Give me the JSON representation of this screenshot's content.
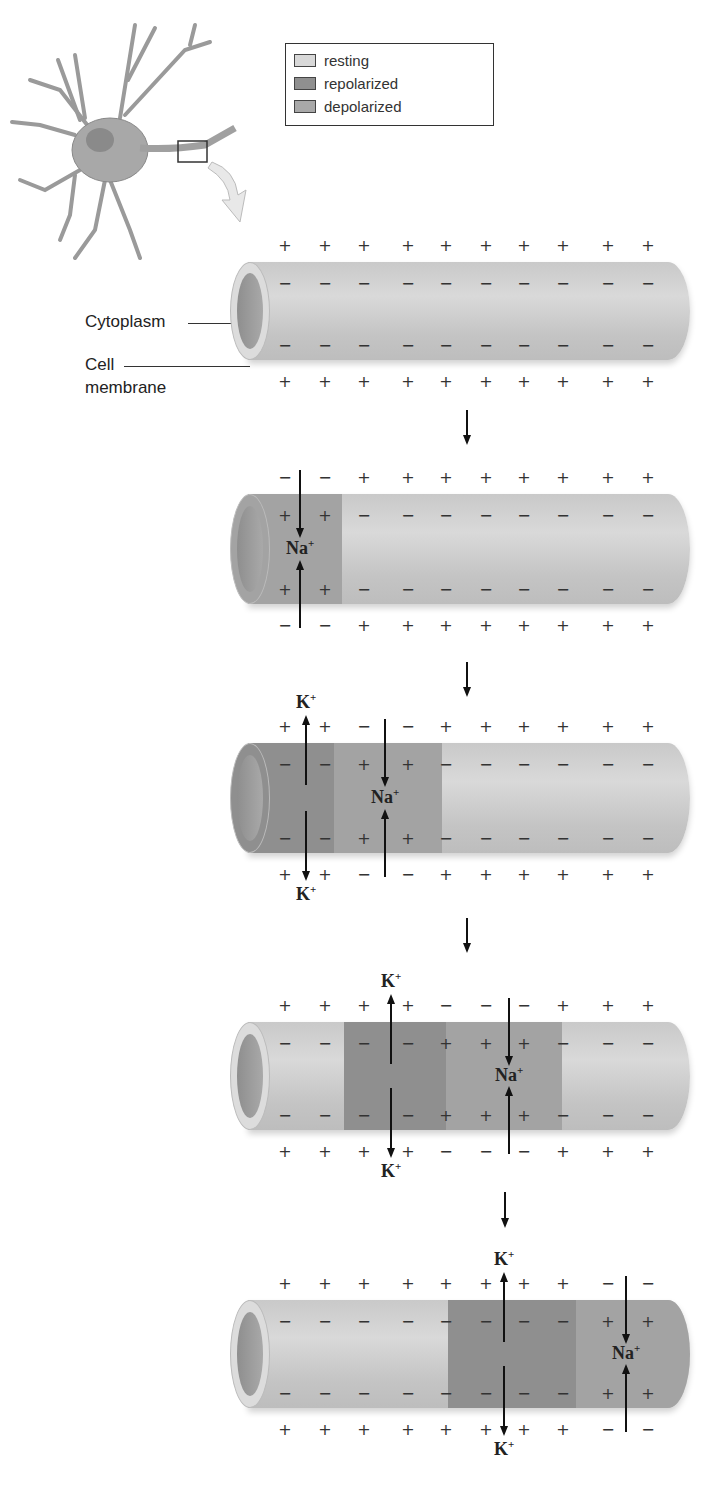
{
  "legend": {
    "items": [
      {
        "label": "resting",
        "color": "#d8d8d8"
      },
      {
        "label": "repolarized",
        "color": "#8f8f8f"
      },
      {
        "label": "depolarized",
        "color": "#a8a8a8"
      }
    ]
  },
  "labels": {
    "cytoplasm": "Cytoplasm",
    "cell_membrane_line1": "Cell",
    "cell_membrane_line2": "membrane"
  },
  "ions": {
    "sodium": "Na",
    "potassium": "K",
    "charge": "+"
  },
  "stages": [
    {
      "name": "resting",
      "outer_top": [
        "+",
        "+",
        "+",
        "+",
        "+",
        "+",
        "+",
        "+",
        "+",
        "+"
      ],
      "inner_top": [
        "−",
        "−",
        "−",
        "−",
        "−",
        "−",
        "−",
        "−",
        "−",
        "−"
      ],
      "inner_bottom": [
        "−",
        "−",
        "−",
        "−",
        "−",
        "−",
        "−",
        "−",
        "−",
        "−"
      ],
      "outer_bottom": [
        "+",
        "+",
        "+",
        "+",
        "+",
        "+",
        "+",
        "+",
        "+",
        "+"
      ]
    },
    {
      "name": "depolarization-start",
      "outer_top": [
        "−",
        "−",
        "+",
        "+",
        "+",
        "+",
        "+",
        "+",
        "+",
        "+"
      ],
      "inner_top": [
        "+",
        "+",
        "−",
        "−",
        "−",
        "−",
        "−",
        "−",
        "−",
        "−"
      ],
      "inner_bottom": [
        "+",
        "+",
        "−",
        "−",
        "−",
        "−",
        "−",
        "−",
        "−",
        "−"
      ],
      "outer_bottom": [
        "−",
        "−",
        "+",
        "+",
        "+",
        "+",
        "+",
        "+",
        "+",
        "+"
      ]
    },
    {
      "name": "propagation-1",
      "outer_top": [
        "+",
        "+",
        "−",
        "−",
        "+",
        "+",
        "+",
        "+",
        "+",
        "+"
      ],
      "inner_top": [
        "−",
        "−",
        "+",
        "+",
        "−",
        "−",
        "−",
        "−",
        "−",
        "−"
      ],
      "inner_bottom": [
        "−",
        "−",
        "+",
        "+",
        "−",
        "−",
        "−",
        "−",
        "−",
        "−"
      ],
      "outer_bottom": [
        "+",
        "+",
        "−",
        "−",
        "+",
        "+",
        "+",
        "+",
        "+",
        "+"
      ]
    },
    {
      "name": "propagation-2",
      "outer_top": [
        "+",
        "+",
        "+",
        "+",
        "−",
        "−",
        "−",
        "+",
        "+",
        "+"
      ],
      "inner_top": [
        "−",
        "−",
        "−",
        "−",
        "+",
        "+",
        "+",
        "−",
        "−",
        "−"
      ],
      "inner_bottom": [
        "−",
        "−",
        "−",
        "−",
        "+",
        "+",
        "+",
        "−",
        "−",
        "−"
      ],
      "outer_bottom": [
        "+",
        "+",
        "+",
        "+",
        "−",
        "−",
        "−",
        "+",
        "+",
        "+"
      ]
    },
    {
      "name": "propagation-3",
      "outer_top": [
        "+",
        "+",
        "+",
        "+",
        "+",
        "+",
        "+",
        "+",
        "−",
        "−"
      ],
      "inner_top": [
        "−",
        "−",
        "−",
        "−",
        "−",
        "−",
        "−",
        "−",
        "+",
        "+"
      ],
      "inner_bottom": [
        "−",
        "−",
        "−",
        "−",
        "−",
        "−",
        "−",
        "−",
        "+",
        "+"
      ],
      "outer_bottom": [
        "+",
        "+",
        "+",
        "+",
        "+",
        "+",
        "+",
        "+",
        "−",
        "−"
      ]
    }
  ]
}
